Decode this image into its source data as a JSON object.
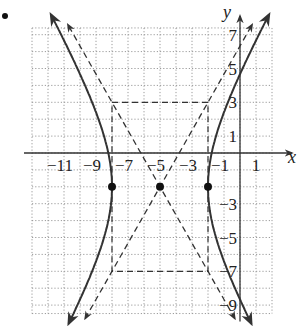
{
  "problem_marker": ".",
  "chart_data": {
    "type": "line",
    "title": "",
    "xlabel": "x",
    "ylabel": "y",
    "x_ticks": [
      -11,
      -9,
      -7,
      -5,
      -3,
      -1,
      1
    ],
    "y_ticks": [
      7,
      5,
      3,
      1,
      -3,
      -5,
      -7,
      -9
    ],
    "xlim": [
      -13,
      2
    ],
    "ylim": [
      -9.5,
      7.4
    ],
    "grid": true,
    "grid_style": "dotted",
    "equation": "(x+5)^2/9 - (y+2)^2/25 = 1",
    "center": [
      -5,
      -2
    ],
    "vertices": [
      [
        -8,
        -2
      ],
      [
        -2,
        -2
      ]
    ],
    "a": 3,
    "b": 5,
    "asymptotes": [
      "y + 2 = (5/3)(x + 5)",
      "y + 2 = -(5/3)(x + 5)"
    ],
    "fundamental_rectangle": {
      "x": [
        -8,
        -2
      ],
      "y": [
        -7,
        3
      ]
    },
    "points": [
      {
        "label": "left vertex",
        "x": -8,
        "y": -2
      },
      {
        "label": "center",
        "x": -5,
        "y": -2
      },
      {
        "label": "right vertex",
        "x": -2,
        "y": -2
      }
    ],
    "series": [
      {
        "name": "hyperbola left branch",
        "style": "solid"
      },
      {
        "name": "hyperbola right branch",
        "style": "solid"
      },
      {
        "name": "asymptote 1",
        "style": "dashed"
      },
      {
        "name": "asymptote 2",
        "style": "dashed"
      },
      {
        "name": "fundamental rectangle",
        "style": "dashed"
      }
    ]
  },
  "style": {
    "curve_color": "#333333",
    "grid_color": "#9a9a9a",
    "axis_color": "#333333"
  }
}
